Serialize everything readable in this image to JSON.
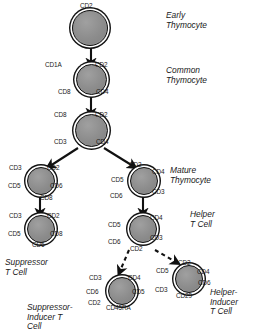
{
  "diagram": {
    "cells": [
      {
        "id": "early-thymocyte",
        "stage_label": "Early\nThymocyte",
        "markers": [
          "CD2"
        ]
      },
      {
        "id": "common-thymocyte",
        "stage_label": "Common\nThymocyte",
        "markers": [
          "CD1A",
          "CD2",
          "CD8",
          "CD4"
        ]
      },
      {
        "id": "intermediate-thymocyte",
        "stage_label": "",
        "markers": [
          "CD8",
          "CD2",
          "CD3",
          "CD4"
        ]
      },
      {
        "id": "mature-thymocyte-cd8",
        "stage_label": "",
        "markers": [
          "CD3",
          "CD2",
          "CD5",
          "CD6",
          "CD8"
        ]
      },
      {
        "id": "mature-thymocyte-cd4",
        "stage_label": "Mature\nThymocyte",
        "markers": [
          "CD2",
          "CD4",
          "CD5",
          "CD3",
          "CD6"
        ]
      },
      {
        "id": "suppressor-t-cell",
        "stage_label": "Suppressor\nT Cell",
        "markers": [
          "CD3",
          "CD2",
          "CD5",
          "CD8",
          "CD6"
        ]
      },
      {
        "id": "helper-t-cell",
        "stage_label": "Helper\nT Cell",
        "markers": [
          "CD5",
          "CD4",
          "CD3",
          "CD6",
          "CD2"
        ]
      },
      {
        "id": "suppressor-inducer-t-cell",
        "stage_label": "Suppressor-\nInducer T\nCell",
        "markers": [
          "CD3",
          "CD4",
          "CD6",
          "CD5",
          "CD2",
          "CD45RA"
        ]
      },
      {
        "id": "helper-inducer-t-cell",
        "stage_label": "Helper-\nInducer\nT Cell",
        "markers": [
          "CD2",
          "CD5",
          "CD4",
          "CD6",
          "CD3",
          "CD29"
        ]
      }
    ],
    "marker_labels": {
      "early_cd2": "CD2",
      "common_cd1a": "CD1A",
      "common_cd2": "CD2",
      "common_cd8": "CD8",
      "common_cd4": "CD4",
      "inter_cd8": "CD8",
      "inter_cd2": "CD2",
      "inter_cd3": "CD3",
      "inter_cd4": "CD4",
      "mat8_cd3": "CD3",
      "mat8_cd2": "CD2",
      "mat8_cd5": "CD5",
      "mat8_cd6": "CD6",
      "mat8_cd8": "CD8",
      "mat4_cd2": "CD2",
      "mat4_cd4": "CD4",
      "mat4_cd5": "CD5",
      "mat4_cd3": "CD3",
      "mat4_cd6": "CD6",
      "sup_cd3": "CD3",
      "sup_cd2": "CD2",
      "sup_cd5": "CD5",
      "sup_cd8": "CD8",
      "sup_cd6": "CD6",
      "help_cd5": "CD5",
      "help_cd4": "CD4",
      "help_cd3": "CD3",
      "help_cd6": "CD6",
      "help_cd2": "CD2",
      "si_cd3": "CD3",
      "si_cd4": "CD4",
      "si_cd6": "CD6",
      "si_cd5": "CD5",
      "si_cd2": "CD2",
      "si_cd45ra": "CD45RA",
      "hi_cd2": "CD2",
      "hi_cd5": "CD5",
      "hi_cd4": "CD4",
      "hi_cd6": "CD6",
      "hi_cd3": "CD3",
      "hi_cd29": "CD29"
    },
    "stage_labels": {
      "early": "Early\nThymocyte",
      "common": "Common\nThymocyte",
      "mature": "Mature\nThymocyte",
      "helper": "Helper\nT Cell",
      "suppressor": "Suppressor\nT Cell",
      "suppressor_inducer": "Suppressor-\nInducer T\nCell",
      "helper_inducer": "Helper-\nInducer\nT Cell"
    },
    "colors": {
      "cell_fill": "#8f8f8f",
      "outline": "#111111",
      "background": "#ffffff",
      "text": "#1a1a1a"
    }
  }
}
